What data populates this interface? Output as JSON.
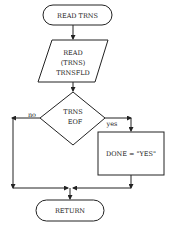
{
  "diagram": {
    "type": "flowchart",
    "colors": {
      "stroke": "#222222",
      "background": "#ffffff"
    },
    "nodes": {
      "start": {
        "shape": "terminal",
        "label": "READ TRNS"
      },
      "read": {
        "shape": "parallelogram",
        "lines": [
          "READ",
          "(TRNS)",
          "TRNSFLD"
        ]
      },
      "decision": {
        "shape": "diamond",
        "lines": [
          "TRNS",
          "EOF"
        ]
      },
      "assign": {
        "shape": "process",
        "label": "DONE = \"YES\""
      },
      "end": {
        "shape": "terminal",
        "label": "RETURN"
      }
    },
    "edges": {
      "no_label": "no",
      "yes_label": "yes"
    }
  }
}
